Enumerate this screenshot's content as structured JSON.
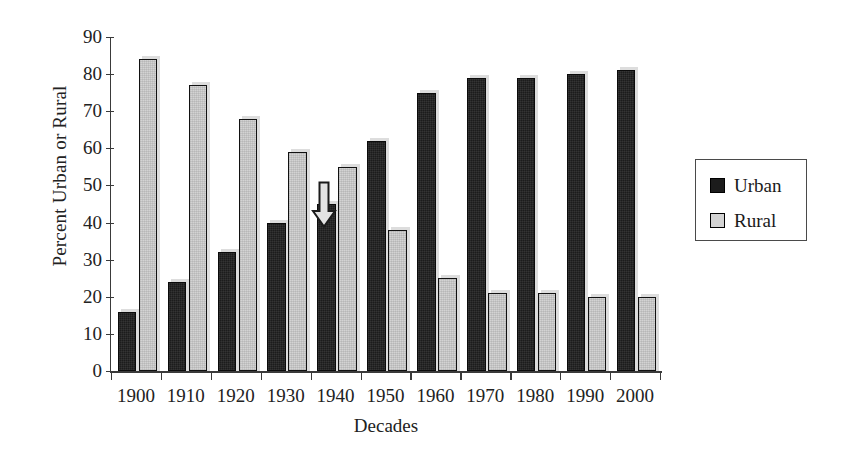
{
  "chart_data": {
    "type": "bar",
    "title": "",
    "xlabel": "Decades",
    "ylabel": "Percent Urban or Rural",
    "categories": [
      "1900",
      "1910",
      "1920",
      "1930",
      "1940",
      "1950",
      "1960",
      "1970",
      "1980",
      "1990",
      "2000"
    ],
    "series": [
      {
        "name": "Urban",
        "color": "#1c1c1c",
        "values": [
          16,
          24,
          32,
          40,
          45,
          62,
          75,
          79,
          79,
          80,
          81
        ]
      },
      {
        "name": "Rural",
        "color": "#d3d3d3",
        "values": [
          84,
          77,
          68,
          59,
          55,
          38,
          25,
          21,
          21,
          20,
          20
        ]
      }
    ],
    "ylim": [
      0,
      90
    ],
    "yticks": [
      0,
      10,
      20,
      30,
      40,
      50,
      60,
      70,
      80,
      90
    ],
    "ytick_labels": [
      "0",
      "10",
      "20",
      "30",
      "40",
      "50",
      "60",
      "70",
      "80",
      "90"
    ],
    "grid": false,
    "legend_position": "right",
    "annotations": [
      {
        "name": "down-arrow",
        "shape": "arrow-down",
        "between": [
          "1930",
          "1940"
        ],
        "value_top": 51,
        "value_bottom": 38
      }
    ]
  },
  "legend": {
    "items": [
      {
        "label": "Urban",
        "swatch": "urban"
      },
      {
        "label": "Rural",
        "swatch": "rural"
      }
    ]
  }
}
